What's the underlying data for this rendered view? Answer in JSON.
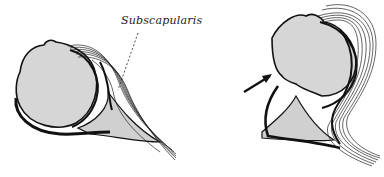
{
  "diagram": {
    "labels": [
      {
        "text": "Subscapularis",
        "x": 121,
        "y": 14
      }
    ],
    "panels": [
      {
        "name": "left-panel",
        "description": "normal humeral head with subscapularis tendon wrapping anteriorly"
      },
      {
        "name": "right-panel",
        "description": "humeral head with arrow indicating anterior defect"
      }
    ],
    "colors": {
      "bone_fill": "#d6d6d6",
      "outline": "#111111",
      "background": "#ffffff"
    }
  }
}
